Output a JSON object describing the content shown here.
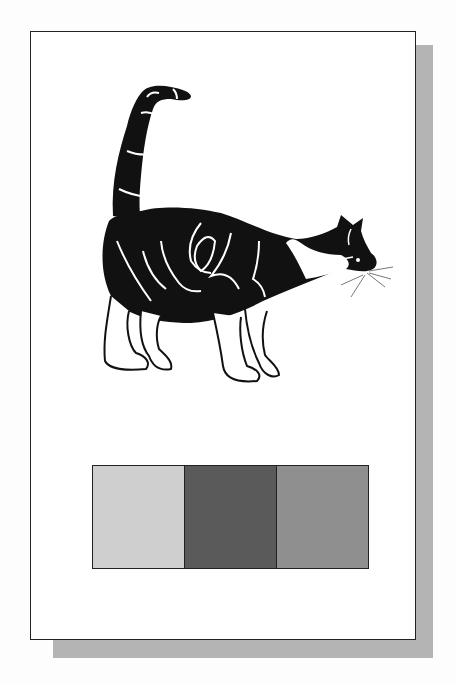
{
  "figure": {
    "swatches": [
      {
        "name": "light-gray",
        "color": "#cfcfcf"
      },
      {
        "name": "dark-gray",
        "color": "#5a5a5a"
      },
      {
        "name": "medium-gray",
        "color": "#8f8f8f"
      }
    ],
    "shadow_color": "#b4b4b4"
  }
}
